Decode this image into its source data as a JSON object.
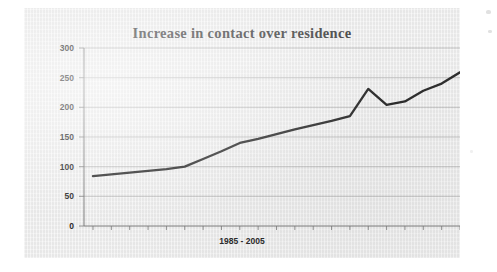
{
  "document": {
    "kind": "scanned-chart-page",
    "page_background": "#ffffff",
    "paper_background": "#ededed"
  },
  "chart_data": {
    "type": "line",
    "title": "Increase in contact over residence",
    "xlabel": "1985 - 2005",
    "ylabel": "",
    "ylim": [
      0,
      300
    ],
    "ytick_labels": [
      "300",
      "250",
      "200",
      "150",
      "100",
      "50",
      "0"
    ],
    "yticks": [
      300,
      250,
      200,
      150,
      100,
      50,
      0
    ],
    "grid": true,
    "legend": false,
    "legend_position": "none",
    "line_color": "#1d1d1d",
    "x": [
      1985,
      1986,
      1987,
      1988,
      1989,
      1990,
      1991,
      1992,
      1993,
      1994,
      1995,
      1996,
      1997,
      1998,
      1999,
      2000,
      2001,
      2002,
      2003,
      2004,
      2005
    ],
    "categories": [
      "1985",
      "1986",
      "1987",
      "1988",
      "1989",
      "1990",
      "1991",
      "1992",
      "1993",
      "1994",
      "1995",
      "1996",
      "1997",
      "1998",
      "1999",
      "2000",
      "2001",
      "2002",
      "2003",
      "2004",
      "2005"
    ],
    "series": [
      {
        "name": "contact orders",
        "values": [
          84,
          87,
          90,
          93,
          96,
          100,
          113,
          126,
          140,
          147,
          155,
          163,
          170,
          177,
          185,
          231,
          204,
          210,
          228,
          240,
          259
        ]
      }
    ],
    "values": [
      84,
      87,
      90,
      93,
      96,
      100,
      113,
      126,
      140,
      147,
      155,
      163,
      170,
      177,
      185,
      231,
      204,
      210,
      228,
      240,
      259
    ],
    "annotations": []
  }
}
